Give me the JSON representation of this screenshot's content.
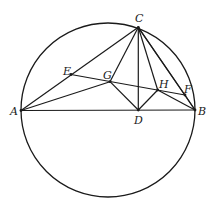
{
  "diagram": {
    "type": "geometry",
    "circle": {
      "cx": 108,
      "cy": 110,
      "r": 87
    },
    "points": {
      "A": {
        "x": 21,
        "y": 110.5,
        "label": "A",
        "lx": 10,
        "ly": 115
      },
      "B": {
        "x": 195,
        "y": 110,
        "label": "B",
        "lx": 198,
        "ly": 115
      },
      "C": {
        "x": 138.3,
        "y": 27.3,
        "label": "C",
        "lx": 135,
        "ly": 22
      },
      "D": {
        "x": 138.3,
        "y": 110,
        "label": "D",
        "lx": 134,
        "ly": 124
      },
      "E": {
        "x": 71,
        "y": 74.5,
        "label": "E",
        "lx": 63,
        "ly": 75
      },
      "G": {
        "x": 110,
        "y": 81.7,
        "label": "G",
        "lx": 103,
        "ly": 79
      },
      "H": {
        "x": 157.7,
        "y": 90,
        "label": "H",
        "lx": 159,
        "ly": 88
      },
      "F": {
        "x": 185,
        "y": 95,
        "label": "F",
        "lx": 184,
        "ly": 93
      }
    },
    "segments": [
      [
        "A",
        "B"
      ],
      [
        "A",
        "C"
      ],
      [
        "A",
        "G"
      ],
      [
        "C",
        "D"
      ],
      [
        "C",
        "G"
      ],
      [
        "C",
        "H"
      ],
      [
        "C",
        "F"
      ],
      [
        "C",
        "B"
      ],
      [
        "E",
        "F"
      ],
      [
        "G",
        "D"
      ],
      [
        "D",
        "H"
      ],
      [
        "H",
        "B"
      ],
      [
        "F",
        "B"
      ]
    ],
    "labels": [
      "A",
      "B",
      "C",
      "D",
      "E",
      "F",
      "G",
      "H"
    ]
  }
}
